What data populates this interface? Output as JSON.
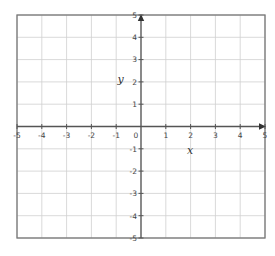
{
  "chart_data": {
    "type": "scatter",
    "title": "",
    "xlabel": "x",
    "ylabel": "y",
    "xlim": [
      -5,
      5
    ],
    "ylim": [
      -5,
      5
    ],
    "grid": true,
    "x_ticks": [
      -5,
      -4,
      -3,
      -2,
      -1,
      0,
      1,
      2,
      3,
      4,
      5
    ],
    "y_ticks": [
      -5,
      -4,
      -3,
      -2,
      -1,
      1,
      2,
      3,
      4,
      5
    ],
    "x_tick_labels": [
      "-5",
      "-4",
      "-3",
      "-2",
      "-1",
      "0",
      "1",
      "2",
      "3",
      "4",
      "5"
    ],
    "y_tick_labels": [
      "-5",
      "-4",
      "-3",
      "-2",
      "-1",
      "1",
      "2",
      "3",
      "4",
      "5"
    ],
    "series": [],
    "legend": null
  },
  "colors": {
    "grid": "#cfcfcf",
    "axis": "#555555",
    "border": "#777777",
    "text": "#444444"
  },
  "layout": {
    "left": 17,
    "right": 265,
    "top": 15,
    "bottom": 238
  }
}
